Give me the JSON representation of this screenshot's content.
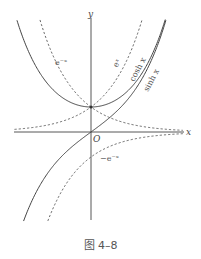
{
  "figure": {
    "caption": "图 4–8",
    "axes": {
      "x_label": "x",
      "y_label": "y",
      "origin_label": "O"
    },
    "curve_labels": {
      "exp_neg": "e⁻ˣ",
      "exp_pos": "eˣ",
      "cosh": "cosh x",
      "sinh": "sinh x",
      "neg_exp_neg": "−e⁻ˣ"
    }
  },
  "chart_data": {
    "type": "line",
    "title": "",
    "caption": "图 4–8",
    "xlabel": "x",
    "ylabel": "y",
    "grid": false,
    "xlim": [
      -2.2,
      2.7
    ],
    "ylim": [
      -3.5,
      4.5
    ],
    "series": [
      {
        "name": "cosh x",
        "function": "cosh(x)",
        "style": "solid",
        "x": [
          -2.2,
          -1.5,
          -1,
          -0.5,
          0,
          0.5,
          1,
          1.5,
          2,
          2.2
        ],
        "values": [
          4.57,
          2.35,
          1.54,
          1.13,
          1.0,
          1.13,
          1.54,
          2.35,
          3.76,
          4.57
        ]
      },
      {
        "name": "sinh x",
        "function": "sinh(x)",
        "style": "solid",
        "x": [
          -2,
          -1.5,
          -1,
          -0.5,
          0,
          0.5,
          1,
          1.5,
          2,
          2.2
        ],
        "values": [
          -3.63,
          -2.13,
          -1.18,
          -0.52,
          0,
          0.52,
          1.18,
          2.13,
          3.63,
          4.46
        ]
      },
      {
        "name": "e^x",
        "function": "exp(x)",
        "style": "dashed",
        "x": [
          -2.2,
          -1.5,
          -1,
          -0.5,
          0,
          0.5,
          1,
          1.5
        ],
        "values": [
          0.11,
          0.22,
          0.37,
          0.61,
          1.0,
          1.65,
          2.72,
          4.48
        ]
      },
      {
        "name": "e^-x",
        "function": "exp(-x)",
        "style": "dashed",
        "x": [
          -1.5,
          -1,
          -0.5,
          0,
          0.5,
          1,
          1.5,
          2,
          2.5
        ],
        "values": [
          4.48,
          2.72,
          1.65,
          1.0,
          0.61,
          0.37,
          0.22,
          0.14,
          0.08
        ]
      },
      {
        "name": "-e^-x",
        "function": "-exp(-x)",
        "style": "dashed",
        "x": [
          -1.3,
          -1,
          -0.5,
          0,
          0.5,
          1,
          1.5,
          2,
          2.5
        ],
        "values": [
          -3.67,
          -2.72,
          -1.65,
          -1.0,
          -0.61,
          -0.37,
          -0.22,
          -0.14,
          -0.08
        ]
      }
    ]
  }
}
